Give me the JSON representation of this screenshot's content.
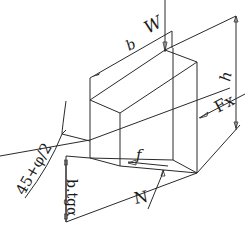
{
  "diagram": {
    "labels": {
      "weight": "W",
      "width": "b",
      "height": "h",
      "horizontal_force": "Fx",
      "friction": "f",
      "normal": "N",
      "angle": "45+φ/2",
      "base_length": "b.tgα"
    }
  }
}
